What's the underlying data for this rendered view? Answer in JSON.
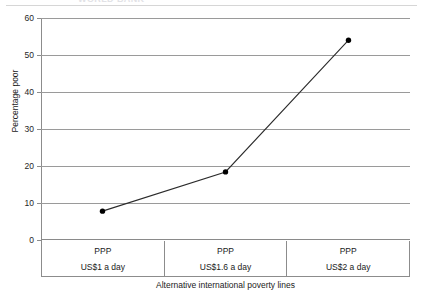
{
  "figure": {
    "clipped_title": "WORLD BANK",
    "y_axis_title": "Percentage poor",
    "x_axis_title": "Alternative international poverty lines",
    "line_color": "#2b2b2b",
    "marker_color": "#000000",
    "grid_color": "#9a9a9a",
    "axis_color": "#8c8c8c",
    "background": "#ffffff"
  },
  "categories": [
    {
      "line1": "PPP",
      "line2": "US$1 a day"
    },
    {
      "line1": "PPP",
      "line2": "US$1.6 a day"
    },
    {
      "line1": "PPP",
      "line2": "US$2 a day"
    }
  ],
  "y_ticks": [
    {
      "label": "0",
      "value": 0
    },
    {
      "label": "10",
      "value": 10
    },
    {
      "label": "20",
      "value": 20
    },
    {
      "label": "30",
      "value": 30
    },
    {
      "label": "40",
      "value": 40
    },
    {
      "label": "50",
      "value": 50
    },
    {
      "label": "60",
      "value": 60
    }
  ],
  "chart_data": {
    "type": "line",
    "title": "",
    "xlabel": "Alternative international poverty lines",
    "ylabel": "Percentage poor",
    "categories": [
      "PPP US$1 a day",
      "PPP US$1.6 a day",
      "PPP US$2 a day"
    ],
    "values": [
      7.8,
      18.4,
      54.0
    ],
    "ylim": [
      0,
      60
    ],
    "yticks": [
      0,
      10,
      20,
      30,
      40,
      50,
      60
    ],
    "grid": "horizontal",
    "legend": "none",
    "markers": "filled-circle",
    "series": [
      {
        "name": "Percentage poor",
        "values": [
          7.8,
          18.4,
          54.0
        ]
      }
    ]
  }
}
